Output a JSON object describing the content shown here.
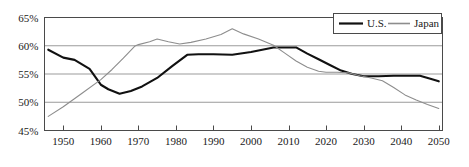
{
  "chart_data": {
    "type": "line",
    "title": "",
    "subtitle": "",
    "xlabel": "",
    "ylabel": "",
    "xlim": [
      1945,
      2051
    ],
    "ylim": [
      45,
      65
    ],
    "grid": true,
    "grid_axis": "y",
    "legend_position": "top-right",
    "y_ticks": [
      45,
      50,
      55,
      60,
      65
    ],
    "y_tick_labels": [
      "45%",
      "50%",
      "55%",
      "60%",
      "65%"
    ],
    "x_ticks": [
      1950,
      1960,
      1970,
      1980,
      1990,
      2000,
      2010,
      2020,
      2030,
      2040,
      2050
    ],
    "x_tick_labels": [
      "1950",
      "1960",
      "1970",
      "1980",
      "1990",
      "2000",
      "2010",
      "2020",
      "2030",
      "2040",
      "2050"
    ],
    "series": [
      {
        "name": "U.S.",
        "color": "#111111",
        "line_width": 2.1,
        "x": [
          1946,
          1950,
          1953,
          1957,
          1960,
          1962,
          1965,
          1968,
          1971,
          1975,
          1979,
          1983,
          1986,
          1990,
          1995,
          2000,
          2003,
          2006,
          2009,
          2012,
          2015,
          2018,
          2021,
          2024,
          2027,
          2030,
          2034,
          2038,
          2042,
          2045,
          2048,
          2050
        ],
        "y": [
          59.3,
          57.9,
          57.5,
          55.9,
          53.1,
          52.3,
          51.5,
          52.0,
          52.8,
          54.3,
          56.4,
          58.4,
          58.5,
          58.5,
          58.4,
          58.9,
          59.3,
          59.7,
          59.7,
          59.7,
          58.6,
          57.6,
          56.6,
          55.6,
          55.0,
          54.6,
          54.6,
          54.7,
          54.7,
          54.7,
          54.1,
          53.7
        ]
      },
      {
        "name": "Japan",
        "color": "#8d8d8d",
        "line_width": 1.1,
        "x": [
          1946,
          1950,
          1955,
          1960,
          1963,
          1966,
          1969,
          1970,
          1973,
          1975,
          1978,
          1981,
          1984,
          1988,
          1992,
          1995,
          1998,
          2002,
          2006,
          2009,
          2012,
          2015,
          2018,
          2020,
          2023,
          2026,
          2029,
          2032,
          2035,
          2038,
          2041,
          2044,
          2047,
          2050
        ],
        "y": [
          47.5,
          49.2,
          51.6,
          54.0,
          55.8,
          57.8,
          59.9,
          60.2,
          60.7,
          61.2,
          60.7,
          60.3,
          60.6,
          61.2,
          62.0,
          63.0,
          62.1,
          61.2,
          60.1,
          58.7,
          57.3,
          56.2,
          55.5,
          55.3,
          55.3,
          55.2,
          54.7,
          54.3,
          53.8,
          52.6,
          51.3,
          50.4,
          49.6,
          48.9
        ]
      }
    ]
  },
  "legend": {
    "items": [
      {
        "label": "U.S.",
        "color": "#111111"
      },
      {
        "label": "Japan",
        "color": "#8d8d8d"
      }
    ]
  },
  "axes": {
    "y_labels": [
      "65%",
      "60%",
      "55%",
      "50%",
      "45%"
    ],
    "x_labels": [
      "1950",
      "1960",
      "1970",
      "1980",
      "1990",
      "2000",
      "2010",
      "2020",
      "2030",
      "2040",
      "2050"
    ]
  },
  "colors": {
    "us_line": "#111111",
    "japan_line": "#8d8d8d",
    "gridline": "#9b9b9b",
    "axis": "#4a4a4a",
    "text": "#1a1a1a",
    "background": "#ffffff"
  }
}
